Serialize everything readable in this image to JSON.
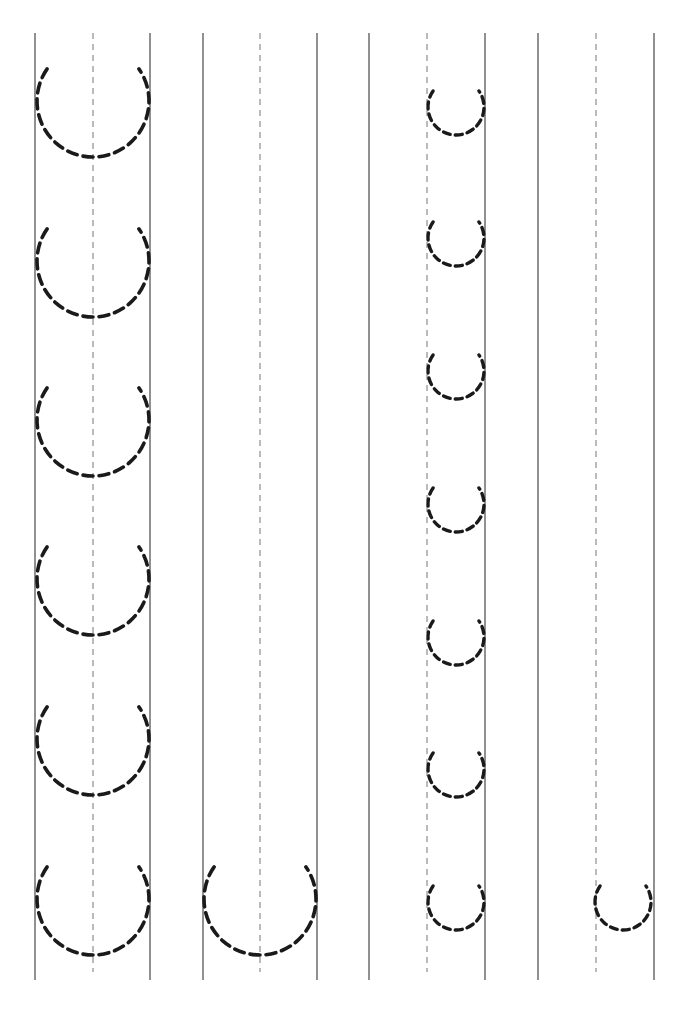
{
  "worksheet": {
    "title": "",
    "letter": "u",
    "ink_color": "#1a1a1a",
    "guide_color": "#555555",
    "line_top": 33,
    "line_bottom": 980,
    "guide_bottom": 972,
    "solid_lines_x": [
      35,
      150,
      203,
      317,
      369,
      485,
      538,
      654
    ],
    "dashed_guides_x": [
      93,
      260,
      427,
      596
    ],
    "large_u": {
      "radius": 56,
      "rows": [
        {
          "cx": 93,
          "bottom": 157
        },
        {
          "cx": 93,
          "bottom": 317
        },
        {
          "cx": 93,
          "bottom": 476
        },
        {
          "cx": 93,
          "bottom": 635
        },
        {
          "cx": 93,
          "bottom": 795
        },
        {
          "cx": 93,
          "bottom": 955
        },
        {
          "cx": 260,
          "bottom": 955
        }
      ]
    },
    "small_u": {
      "radius": 28,
      "rows": [
        {
          "cx": 456,
          "bottom": 135
        },
        {
          "cx": 456,
          "bottom": 266
        },
        {
          "cx": 456,
          "bottom": 399
        },
        {
          "cx": 456,
          "bottom": 532
        },
        {
          "cx": 456,
          "bottom": 665
        },
        {
          "cx": 456,
          "bottom": 797
        },
        {
          "cx": 456,
          "bottom": 930
        },
        {
          "cx": 623,
          "bottom": 930
        }
      ]
    }
  }
}
